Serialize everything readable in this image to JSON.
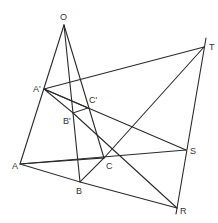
{
  "diagram": {
    "points": {
      "O": {
        "label": "O",
        "x": 64,
        "y": 25
      },
      "A1": {
        "label": "A'",
        "x": 44,
        "y": 89
      },
      "B1": {
        "label": "B'",
        "x": 73,
        "y": 113
      },
      "C1": {
        "label": "C'",
        "x": 88,
        "y": 108
      },
      "A": {
        "label": "A",
        "x": 20,
        "y": 164
      },
      "B": {
        "label": "B",
        "x": 80,
        "y": 182
      },
      "C": {
        "label": "C",
        "x": 104,
        "y": 158
      },
      "T": {
        "label": "T",
        "x": 204,
        "y": 47
      },
      "S": {
        "label": "S",
        "x": 186,
        "y": 150
      },
      "R": {
        "label": "R",
        "x": 177,
        "y": 208
      }
    },
    "labels": {
      "O": "O",
      "A1": "A'",
      "B1": "B'",
      "C1": "C'",
      "A": "A",
      "B": "B",
      "C": "C",
      "T": "T",
      "S": "S",
      "R": "R"
    },
    "hatched_triangles": [
      [
        "A1",
        "B1",
        "C1"
      ],
      [
        "A",
        "B",
        "C"
      ]
    ],
    "line_color": "#2a2a2a"
  }
}
